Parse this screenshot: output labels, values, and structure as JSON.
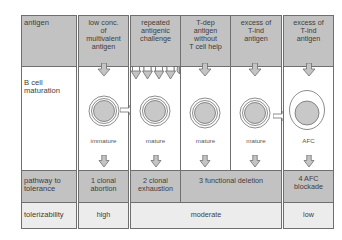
{
  "colors": {
    "dark_cell": "#c2c2c2",
    "light_cell": "#ececec",
    "border": "#6f6f6f",
    "cell_fill": "#c8c8c8",
    "arrow_fill": "#c4c4c4"
  },
  "rows": {
    "antigen": "antigen",
    "maturation": "B cell maturation",
    "pathway": "pathway to tolerance",
    "tolerizability": "tolerizability"
  },
  "columns": [
    {
      "antigen": "low conc. of multivalent antigen",
      "cell_stage": "immature",
      "pathway": "1 clonal abortion",
      "tolerizability": "high"
    },
    {
      "antigen": "repeated antigenic challenge",
      "cell_stage": "mature",
      "pathway": "2 clonal exhaustion",
      "tolerizability": "moderate"
    },
    {
      "antigen": "T-dep antigen without T cell help",
      "cell_stage": "mature",
      "pathway": "3 functional deletion",
      "tolerizability": "moderate"
    },
    {
      "antigen": "excess of T-ind antigen",
      "cell_stage": "mature",
      "pathway": "3 functional deletion",
      "tolerizability": "moderate"
    },
    {
      "antigen": "excess of T-ind antigen",
      "cell_stage": "AFC",
      "pathway": "4 AFC blockade",
      "tolerizability": "low"
    }
  ],
  "labels": {
    "row_antigen": "antigen",
    "row_maturation_1": "B cell",
    "row_maturation_2": "maturation",
    "row_pathway_1": "pathway to",
    "row_pathway_2": "tolerance",
    "row_tolerizability": "tolerizability",
    "c1_antigen": [
      "low conc.",
      "of",
      "multivalent",
      "antigen"
    ],
    "c2_antigen": [
      "repeated",
      "antigenic",
      "challenge"
    ],
    "c3_antigen": [
      "T-dep",
      "antigen",
      "without",
      "T cell help"
    ],
    "c4_antigen": [
      "excess of",
      "T-ind",
      "antigen"
    ],
    "c5_antigen": [
      "excess of",
      "T-ind",
      "antigen"
    ],
    "c1_stage": "immature",
    "c2_stage": "mature",
    "c3_stage": "mature",
    "c4_stage": "mature",
    "c5_stage": "AFC",
    "p1": [
      "1 clonal",
      "abortion"
    ],
    "p2": [
      "2 clonal",
      "exhaustion"
    ],
    "p3": "3 functional deletion",
    "p4": [
      "4 AFC",
      "blockade"
    ],
    "t1": "high",
    "t2": "moderate",
    "t3": "low"
  }
}
